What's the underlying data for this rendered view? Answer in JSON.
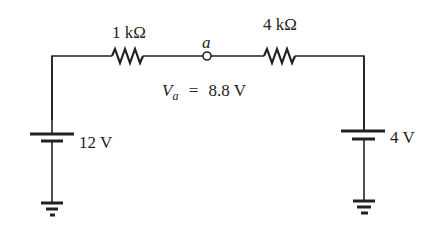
{
  "diagram": {
    "type": "circuit",
    "components": {
      "r1": {
        "label": "1 kΩ"
      },
      "r2": {
        "label": "4 kΩ"
      },
      "node_a": {
        "label": "a"
      },
      "v_left": {
        "label": "12 V"
      },
      "v_right": {
        "label": "4 V"
      },
      "va": {
        "symbol": "V",
        "subscript": "a",
        "equals": "=",
        "value": "8.8 V"
      }
    },
    "colors": {
      "wire": "#222222",
      "background": "#ffffff"
    }
  }
}
